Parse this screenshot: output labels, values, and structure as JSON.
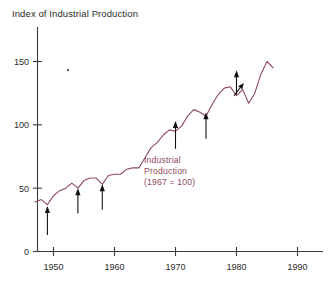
{
  "chart_data": {
    "type": "line",
    "title": "Index of Industrial Production",
    "xlabel": "",
    "ylabel": "",
    "xlim": [
      1946,
      1991
    ],
    "ylim": [
      0,
      172
    ],
    "grid": false,
    "legend": "none",
    "xticks": [
      "1950",
      "1960",
      "1970",
      "1980",
      "1990"
    ],
    "xtick_values": [
      1950,
      1960,
      1970,
      1980,
      1990
    ],
    "yticks": [
      "0",
      "50",
      "100",
      "150"
    ],
    "ytick_values": [
      0,
      50,
      100,
      150
    ],
    "series": [
      {
        "name": "Industrial Production (1967 = 100)",
        "color": "#8d4a59",
        "x": [
          1947,
          1948,
          1949,
          1950,
          1951,
          1952,
          1953,
          1954,
          1955,
          1956,
          1957,
          1958,
          1959,
          1960,
          1961,
          1962,
          1963,
          1964,
          1965,
          1966,
          1967,
          1968,
          1969,
          1970,
          1971,
          1972,
          1973,
          1974,
          1975,
          1976,
          1977,
          1978,
          1979,
          1980,
          1981,
          1982,
          1983,
          1984,
          1985,
          1986
        ],
        "values": [
          39,
          41,
          37,
          44,
          48,
          50,
          54,
          50,
          56,
          58,
          58,
          53,
          60,
          61,
          61,
          65,
          66,
          66,
          74,
          82,
          86,
          92,
          96,
          95,
          99,
          107,
          112,
          110,
          107,
          116,
          124,
          129,
          130,
          123,
          128,
          117,
          125,
          140,
          150,
          145
        ]
      }
    ],
    "series_annotation": {
      "lines": [
        "Industrial",
        "Production",
        "(1967 = 100)"
      ],
      "color": "#8d4a59"
    },
    "recession_arrows": [
      {
        "year": 1949,
        "label": "recession-arrow-1949",
        "tip_value": 36,
        "tail_value": 13
      },
      {
        "year": 1954,
        "label": "recession-arrow-1954",
        "tip_value": 50,
        "tail_value": 30
      },
      {
        "year": 1958,
        "label": "recession-arrow-1958",
        "tip_value": 53,
        "tail_value": 33
      },
      {
        "year": 1970,
        "label": "recession-arrow-1970",
        "tip_value": 103,
        "tail_value": 81
      },
      {
        "year": 1975,
        "label": "recession-arrow-1975",
        "tip_value": 110,
        "tail_value": 89
      },
      {
        "year": 1980,
        "label": "recession-arrow-1980",
        "tip_value": 143,
        "tail_value": 124
      }
    ],
    "diagonal_arrow": {
      "label": "recession-arrow-1982",
      "from_year": 1979.6,
      "from_value": 123,
      "to_year": 1981.2,
      "to_value": 133
    }
  }
}
